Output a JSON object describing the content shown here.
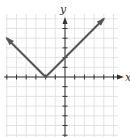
{
  "chart_data": {
    "type": "line",
    "title": "",
    "function": "y = |x + 2|",
    "xlabel": "x",
    "ylabel": "y",
    "xlim": [
      -6,
      5.5
    ],
    "ylim": [
      -6,
      6.5
    ],
    "grid": true,
    "grid_step": 1,
    "legend": "none",
    "series": [
      {
        "name": "y = |x + 2|",
        "x": [
          -6,
          -2,
          4
        ],
        "y": [
          4,
          0,
          6
        ],
        "arrows_at_ends": true,
        "color": "#555555"
      }
    ],
    "points": {
      "vertex": [
        -2,
        0
      ],
      "y_intercept": [
        0,
        2
      ]
    }
  },
  "colors": {
    "grid": "#dcdcdc",
    "axis": "#333333",
    "line": "#555555"
  },
  "labels": {
    "x": "x",
    "y": "y"
  }
}
